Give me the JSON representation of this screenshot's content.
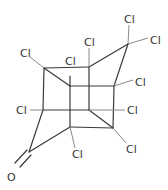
{
  "molecule": {
    "name": "chlordecone-like cage",
    "atoms": [
      {
        "label": "Cl",
        "x": 23,
        "y": 53
      },
      {
        "label": "Cl",
        "x": 88,
        "y": 44
      },
      {
        "label": "Cl",
        "x": 69,
        "y": 63
      },
      {
        "label": "Cl",
        "x": 128,
        "y": 21
      },
      {
        "label": "Cl",
        "x": 152,
        "y": 43
      },
      {
        "label": "Cl",
        "x": 138,
        "y": 84
      },
      {
        "label": "Cl",
        "x": 21,
        "y": 114
      },
      {
        "label": "Cl",
        "x": 130,
        "y": 114
      },
      {
        "label": "Cl",
        "x": 77,
        "y": 156
      },
      {
        "label": "Cl",
        "x": 130,
        "y": 151
      },
      {
        "label": "O",
        "x": 11,
        "y": 175
      }
    ]
  }
}
